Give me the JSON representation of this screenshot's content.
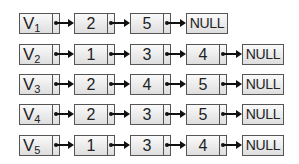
{
  "diagram": {
    "type": "adjacency-list",
    "null_label": "NULL",
    "colors": {
      "border": "#555555",
      "fill_top": "#fafafa",
      "fill_bottom": "#dedede",
      "arrow": "#111111"
    },
    "rows": [
      {
        "head": "V",
        "sub": "1",
        "nodes": [
          "2",
          "5"
        ]
      },
      {
        "head": "V",
        "sub": "2",
        "nodes": [
          "1",
          "3",
          "4"
        ]
      },
      {
        "head": "V",
        "sub": "3",
        "nodes": [
          "2",
          "4",
          "5"
        ]
      },
      {
        "head": "V",
        "sub": "4",
        "nodes": [
          "2",
          "3",
          "5"
        ]
      },
      {
        "head": "V",
        "sub": "5",
        "nodes": [
          "1",
          "3",
          "4"
        ]
      }
    ]
  }
}
